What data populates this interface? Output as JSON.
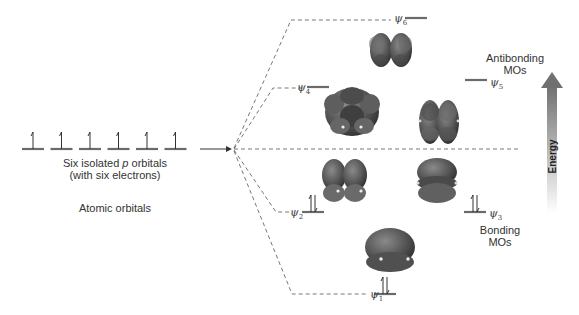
{
  "atomic": {
    "orbital_count": 6,
    "caption_line1_pre": "Six isolated ",
    "caption_line1_italic": "p",
    "caption_line1_post": " orbitals",
    "caption_line2": "(with six electrons)",
    "group_label": "Atomic orbitals"
  },
  "molecular_orbitals": [
    {
      "name": "ψ",
      "index": "1",
      "electrons": 2,
      "type": "bonding"
    },
    {
      "name": "ψ",
      "index": "2",
      "electrons": 2,
      "type": "bonding"
    },
    {
      "name": "ψ",
      "index": "3",
      "electrons": 2,
      "type": "bonding"
    },
    {
      "name": "ψ",
      "index": "4",
      "electrons": 0,
      "type": "antibonding"
    },
    {
      "name": "ψ",
      "index": "5",
      "electrons": 0,
      "type": "antibonding"
    },
    {
      "name": "ψ",
      "index": "6",
      "electrons": 0,
      "type": "antibonding"
    }
  ],
  "labels": {
    "antibonding_line1": "Antibonding",
    "antibonding_line2": "MOs",
    "bonding_line1": "Bonding",
    "bonding_line2": "MOs",
    "energy": "Energy"
  },
  "colors": {
    "level": "#6b6b6b",
    "orbital_lobe": "#5a5a5a",
    "arrow_top": "#666666",
    "dash": "#555555"
  }
}
